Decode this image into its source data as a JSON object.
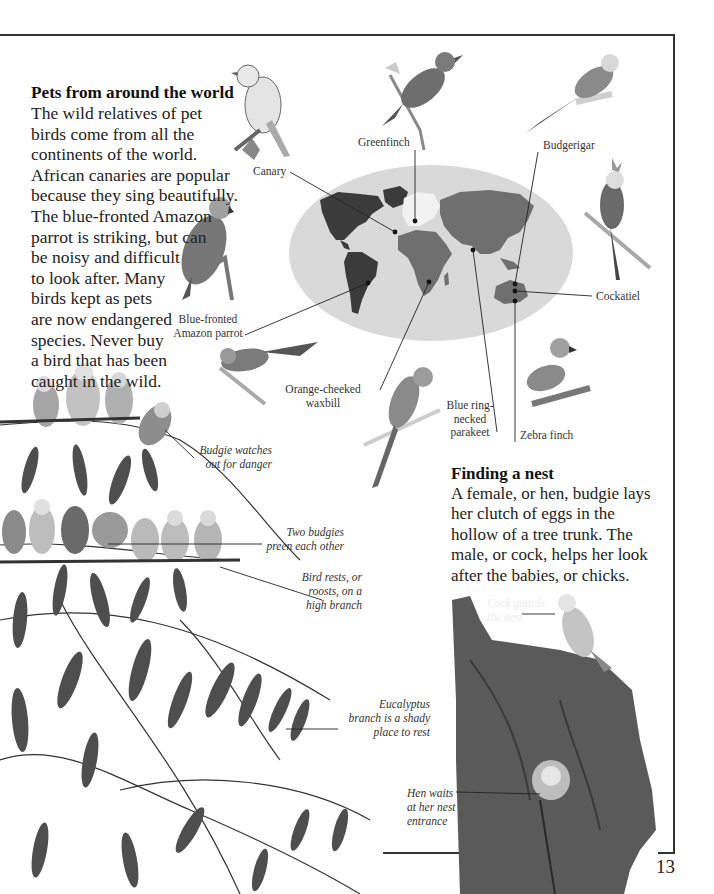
{
  "page": {
    "number": "13"
  },
  "intro": {
    "heading": "Pets from around the world",
    "lines": [
      "The wild relatives of pet",
      "birds come from all the",
      "continents of the world.",
      "African canaries are popular",
      "because they sing beautifully.",
      "The blue-fronted Amazon",
      "parrot is striking, but can",
      "be noisy and difficult",
      "to look after. Many",
      "birds kept as pets",
      "are now endangered",
      "species. Never buy",
      "a bird that has been",
      "caught in the wild."
    ]
  },
  "nest": {
    "heading": "Finding a nest",
    "lines": [
      "A female, or hen, budgie lays",
      "her clutch of eggs in the",
      "hollow of a tree trunk. The",
      "male, or cock, helps her look",
      "after the babies, or chicks."
    ]
  },
  "bird_labels": {
    "canary": "Canary",
    "greenfinch": "Greenfinch",
    "budgerigar": "Budgerigar",
    "cockatiel": "Cockatiel",
    "amazon_line1": "Blue-fronted",
    "amazon_line2": "Amazon parrot",
    "waxbill_line1": "Orange-cheeked",
    "waxbill_line2": "waxbill",
    "parakeet_line1": "Blue ring-",
    "parakeet_line2": "necked",
    "parakeet_line3": "parakeet",
    "zebra_finch": "Zebra finch"
  },
  "captions": {
    "watch_line1": "Budgie watches",
    "watch_line2": "out for danger",
    "preen_line1": "Two budgies",
    "preen_line2": "preen each other",
    "roost_line1": "Bird rests, or",
    "roost_line2": "roosts, on a",
    "roost_line3": "high branch",
    "eucalyptus_line1": "Eucalyptus",
    "eucalyptus_line2": "branch is a shady",
    "eucalyptus_line3": "place to rest",
    "cock_line1": "Cock guards",
    "cock_line2": "the nest",
    "hen_line1": "Hen waits",
    "hen_line2": "at her nest",
    "hen_line3": "entrance"
  },
  "map": {
    "ocean_color": "#d9d9d9",
    "americas_color": "#3b3b3b",
    "africa_asia_color": "#6f6f6f",
    "europe_color": "#f2f2f2"
  }
}
